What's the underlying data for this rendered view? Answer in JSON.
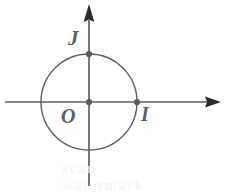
{
  "figure": {
    "kind": "unit-circle-diagram",
    "background_color": "#ffffff",
    "stroke_color": "#5d5d5d",
    "label_color": "#5d5d5d",
    "ghost_color": "#f2f2f2",
    "canvas": {
      "width": 235,
      "height": 193
    },
    "origin": {
      "x": 89,
      "y": 102
    },
    "radius": 48,
    "axes": {
      "x": {
        "name": "horizontal-axis",
        "x1": 5,
        "y1": 102,
        "x2": 221,
        "y2": 102,
        "arrow": "right"
      },
      "y": {
        "name": "vertical-axis",
        "x1": 89,
        "y1": 186,
        "x2": 89,
        "y2": 4,
        "arrow": "up"
      }
    },
    "points": [
      {
        "id": "O",
        "label": "O",
        "x": 89,
        "y": 102,
        "label_x": 61,
        "label_y": 106,
        "dot": true
      },
      {
        "id": "I",
        "label": "I",
        "x": 137,
        "y": 102,
        "label_x": 141,
        "label_y": 104,
        "dot": true
      },
      {
        "id": "J",
        "label": "J",
        "x": 89,
        "y": 54,
        "label_x": 68,
        "label_y": 28,
        "dot": true
      }
    ],
    "ghost_artifact": "scan watermark"
  }
}
